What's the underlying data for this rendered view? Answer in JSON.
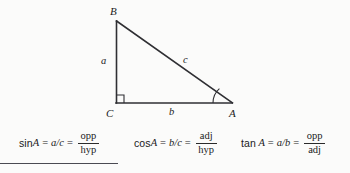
{
  "figure": {
    "name": "right-triangle-trigonometry-diagram",
    "vertices": [
      {
        "id": "B",
        "label": "B",
        "x": 116,
        "y": 21
      },
      {
        "id": "C",
        "label": "C",
        "x": 116,
        "y": 103
      },
      {
        "id": "A",
        "label": "A",
        "x": 232,
        "y": 103
      }
    ],
    "side_labels": [
      {
        "id": "a",
        "label": "a",
        "side": "BC",
        "description": "opposite-side"
      },
      {
        "id": "b",
        "label": "b",
        "side": "CA",
        "description": "adjacent-side"
      },
      {
        "id": "c",
        "label": "c",
        "side": "AB",
        "description": "hypotenuse"
      }
    ],
    "markers": {
      "right_angle_at": "C",
      "angle_arc_at": "A"
    },
    "stroke_color": "#2f2f33",
    "background_color": "#fbfbfa"
  },
  "formulas": [
    {
      "id": "sine",
      "fn": "sin",
      "space_after_fn": false,
      "angle": "A",
      "eq1": "=",
      "ratio": "a/c",
      "eq2": "=",
      "numerator": "opp",
      "denominator": "hyp"
    },
    {
      "id": "cosine",
      "fn": "cos",
      "space_after_fn": false,
      "angle": "A",
      "eq1": "=",
      "ratio": "b/c",
      "eq2": "=",
      "numerator": "adj",
      "denominator": "hyp"
    },
    {
      "id": "tangent",
      "fn": "tan",
      "space_after_fn": true,
      "angle": "A",
      "eq1": "=",
      "ratio": "a/b",
      "eq2": "=",
      "numerator": "opp",
      "denominator": "adj"
    }
  ],
  "rule": {
    "color": "#4a4a52"
  }
}
